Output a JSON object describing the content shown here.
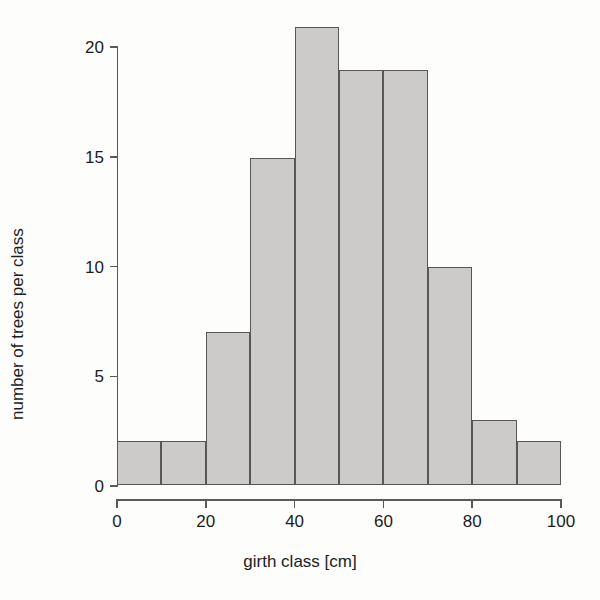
{
  "chart_data": {
    "type": "bar",
    "title": "",
    "subtitle": "",
    "xlabel": "girth class [cm]",
    "ylabel": "number of trees per class",
    "categories": [
      "0-10",
      "10-20",
      "20-30",
      "30-40",
      "40-50",
      "50-60",
      "60-70",
      "70-80",
      "80-90",
      "90-100"
    ],
    "bin_edges": [
      0,
      10,
      20,
      30,
      40,
      50,
      60,
      70,
      80,
      90,
      100
    ],
    "values": [
      2,
      2,
      7,
      15,
      21,
      19,
      19,
      10,
      3,
      2
    ],
    "xlim": [
      0,
      100
    ],
    "ylim": [
      0,
      21.3
    ],
    "xticks": [
      0,
      20,
      40,
      60,
      80,
      100
    ],
    "xtick_labels": [
      "0",
      "20",
      "40",
      "60",
      "80",
      "100"
    ],
    "yticks": [
      0,
      5,
      10,
      15,
      20
    ],
    "ytick_labels": [
      "0",
      "5",
      "10",
      "15",
      "20"
    ],
    "grid": false,
    "legend": null,
    "legend_position": "none",
    "annotations": [],
    "colors": {
      "bar_fill": "#cccbc9",
      "bar_border": "#585756",
      "axis": "#5a5957",
      "text": "#1c1c1c",
      "background": "#fdfdfc"
    }
  }
}
